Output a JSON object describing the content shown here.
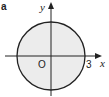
{
  "figure": {
    "part_label": "a",
    "x_axis_label": "x",
    "y_axis_label": "y",
    "origin_label": "O",
    "radius_label": "3",
    "circle": {
      "center": [
        0,
        0
      ],
      "radius": 3,
      "shaded": true
    },
    "colors": {
      "fill": "#ececec",
      "stroke": "#222222"
    }
  }
}
